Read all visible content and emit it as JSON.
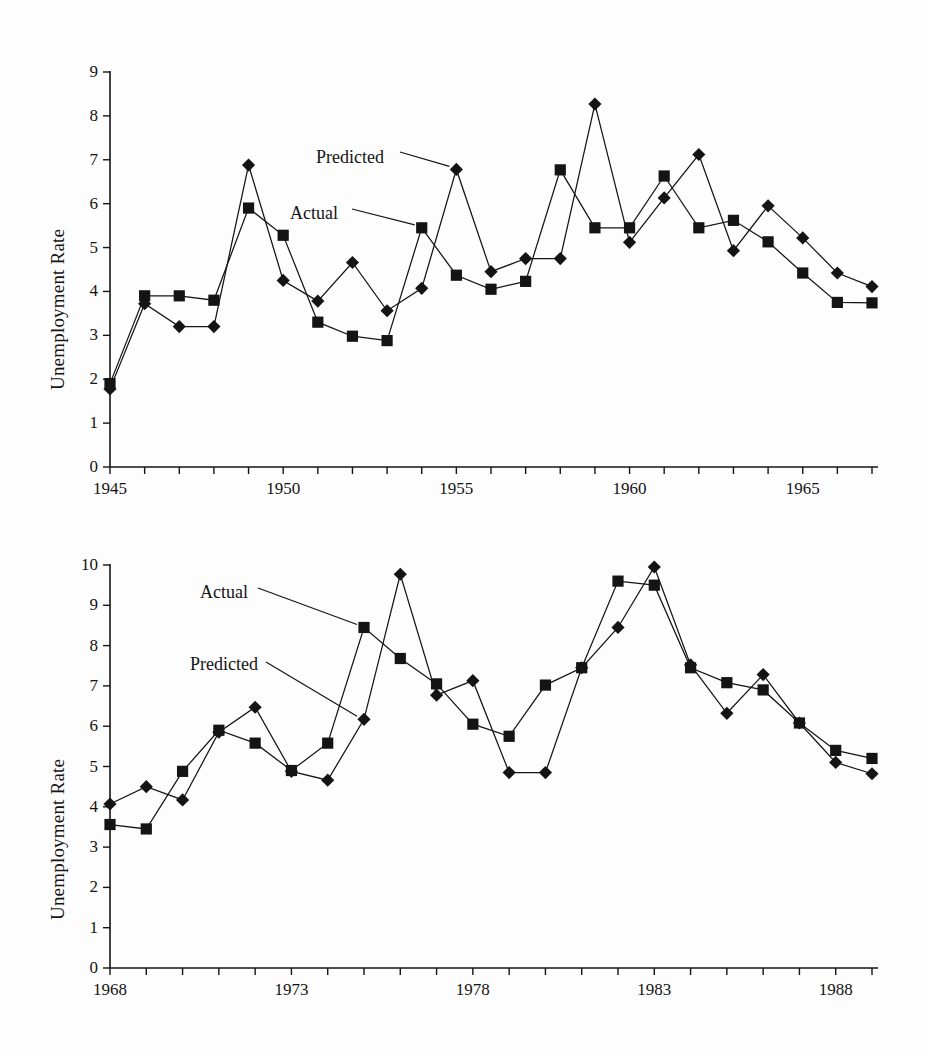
{
  "page": {
    "background_color": "#fdfdfd",
    "ink_color": "#141414"
  },
  "chart_data": [
    {
      "id": "top",
      "type": "line",
      "title": "",
      "xlabel": "",
      "ylabel": "Unemployment Rate",
      "xlim": [
        1945,
        1967
      ],
      "ylim": [
        0,
        9
      ],
      "ytick_step": 1,
      "xtick_step": 1,
      "xtick_label_step": 5,
      "grid": false,
      "legend_position": "inline-annotations",
      "yticks": [
        "0",
        "1",
        "2",
        "3",
        "4",
        "5",
        "6",
        "7",
        "8",
        "9"
      ],
      "xticks": [
        "1945",
        "1950",
        "1955",
        "1960",
        "1965"
      ],
      "x": [
        1945,
        1946,
        1947,
        1948,
        1949,
        1950,
        1951,
        1952,
        1953,
        1954,
        1955,
        1956,
        1957,
        1958,
        1959,
        1960,
        1961,
        1962,
        1963,
        1964,
        1965,
        1966,
        1967
      ],
      "series": [
        {
          "name": "Actual",
          "marker": "square",
          "values": [
            1.9,
            3.9,
            3.9,
            3.8,
            5.9,
            5.28,
            3.3,
            2.98,
            2.88,
            5.45,
            4.37,
            4.05,
            4.23,
            6.77,
            5.45,
            5.45,
            6.63,
            5.45,
            5.62,
            5.13,
            4.42,
            3.75,
            3.74
          ]
        },
        {
          "name": "Predicted",
          "marker": "diamond",
          "values": [
            1.78,
            3.72,
            3.2,
            3.2,
            6.88,
            4.25,
            3.78,
            4.66,
            3.56,
            4.07,
            6.78,
            4.45,
            4.75,
            4.75,
            8.27,
            5.12,
            6.13,
            7.12,
            4.93,
            5.95,
            5.22,
            4.42,
            4.11
          ]
        }
      ],
      "annotations": [
        {
          "text": "Predicted",
          "points_to_year": 1955,
          "points_to_series": "Predicted"
        },
        {
          "text": "Actual",
          "points_to_year": 1954,
          "points_to_series": "Actual"
        }
      ]
    },
    {
      "id": "bottom",
      "type": "line",
      "title": "",
      "xlabel": "",
      "ylabel": "Unemployment Rate",
      "xlim": [
        1968,
        1989
      ],
      "ylim": [
        0,
        10
      ],
      "ytick_step": 1,
      "xtick_step": 1,
      "xtick_label_step": 5,
      "grid": false,
      "legend_position": "inline-annotations",
      "yticks": [
        "0",
        "1",
        "2",
        "3",
        "4",
        "5",
        "6",
        "7",
        "8",
        "9",
        "10"
      ],
      "xticks": [
        "1968",
        "1973",
        "1978",
        "1983",
        "1988"
      ],
      "x": [
        1968,
        1969,
        1970,
        1971,
        1972,
        1973,
        1974,
        1975,
        1976,
        1977,
        1978,
        1979,
        1980,
        1981,
        1982,
        1983,
        1984,
        1985,
        1986,
        1987,
        1988,
        1989
      ],
      "series": [
        {
          "name": "Actual",
          "marker": "square",
          "values": [
            3.56,
            3.45,
            4.88,
            5.9,
            5.58,
            4.9,
            5.58,
            8.45,
            7.68,
            7.05,
            6.05,
            5.75,
            7.02,
            7.45,
            9.6,
            9.5,
            7.45,
            7.08,
            6.9,
            6.08,
            5.4,
            5.2
          ]
        },
        {
          "name": "Predicted",
          "marker": "diamond",
          "values": [
            4.07,
            4.5,
            4.17,
            5.85,
            6.47,
            4.88,
            4.66,
            6.17,
            9.77,
            6.77,
            7.13,
            4.85,
            4.85,
            7.45,
            8.45,
            9.95,
            7.52,
            6.32,
            7.28,
            6.08,
            5.1,
            4.82
          ]
        }
      ],
      "annotations": [
        {
          "text": "Actual",
          "points_to_year": 1975,
          "points_to_series": "Actual"
        },
        {
          "text": "Predicted",
          "points_to_year": 1975,
          "points_to_series": "Predicted"
        }
      ]
    }
  ]
}
